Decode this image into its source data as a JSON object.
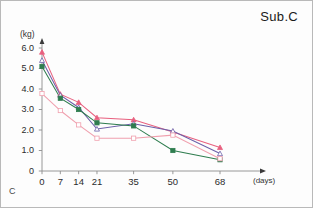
{
  "title": "Sub.C",
  "panel_label": "C",
  "axes": {
    "y_unit_label": "(kg)",
    "x_unit_label": "(days)",
    "y_ticks": [
      "6.0",
      "5.0",
      "4.0",
      "3.0",
      "2.0",
      "1.0",
      "0"
    ],
    "x_ticks": [
      "0",
      "7",
      "14",
      "21",
      "35",
      "50",
      "68"
    ]
  },
  "chart_data": {
    "type": "line",
    "title": "Sub.C",
    "xlabel": "(days)",
    "ylabel": "(kg)",
    "xlim": [
      0,
      80
    ],
    "ylim": [
      0,
      6.5
    ],
    "grid": false,
    "legend": "none",
    "x": [
      0,
      7,
      14,
      21,
      35,
      50,
      68
    ],
    "x_tick_labels": [
      "0",
      "7",
      "14",
      "21",
      "35",
      "50",
      "68"
    ],
    "y_tick_labels": [
      "0",
      "1.0",
      "2.0",
      "3.0",
      "4.0",
      "5.0",
      "6.0"
    ],
    "series": [
      {
        "name": "series-1",
        "color": "#e8607f",
        "marker": "triangle",
        "values": [
          5.8,
          3.75,
          3.35,
          2.6,
          2.5,
          1.9,
          1.15
        ]
      },
      {
        "name": "series-2",
        "color": "#6b5fa8",
        "marker": "triangle-open",
        "values": [
          5.4,
          3.7,
          3.1,
          2.05,
          2.3,
          1.95,
          0.85
        ]
      },
      {
        "name": "series-3",
        "color": "#2f7d4f",
        "marker": "square",
        "values": [
          5.1,
          3.55,
          3.0,
          2.35,
          2.2,
          1.0,
          0.55
        ]
      },
      {
        "name": "series-4",
        "color": "#f0a0ae",
        "marker": "square-open",
        "values": [
          3.78,
          2.95,
          2.25,
          1.6,
          1.6,
          1.75,
          0.6
        ]
      }
    ]
  }
}
